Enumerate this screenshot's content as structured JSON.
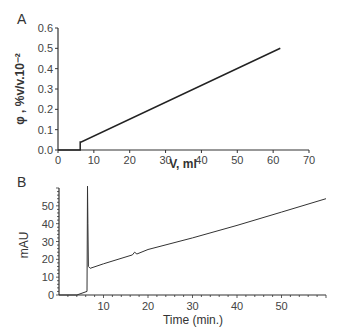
{
  "chart_data": [
    {
      "panel": "A",
      "type": "line",
      "title": "",
      "xlabel": "V, ml",
      "ylabel": "φ , %v/v.10⁻²",
      "xlim": [
        0,
        70
      ],
      "ylim": [
        0,
        0.6
      ],
      "xticks": [
        "0",
        "10",
        "20",
        "30",
        "40",
        "50",
        "60",
        "70"
      ],
      "yticks": [
        "0.0",
        "0.1",
        "0.2",
        "0.3",
        "0.4",
        "0.5",
        "0.6"
      ],
      "grid": false,
      "series": [
        {
          "name": "gradient",
          "x": [
            0,
            6.2,
            6.2,
            6.5,
            62
          ],
          "y": [
            0,
            0,
            0.04,
            0.04,
            0.5
          ]
        }
      ]
    },
    {
      "panel": "B",
      "type": "line",
      "title": "",
      "xlabel": "Time (min.)",
      "ylabel": "mAU",
      "xlim": [
        0,
        60
      ],
      "ylim": [
        0,
        60
      ],
      "xticks": [
        "10",
        "20",
        "30",
        "40",
        "50"
      ],
      "yticks": [
        "0",
        "10",
        "20",
        "30",
        "40",
        "50"
      ],
      "grid": false,
      "series": [
        {
          "name": "absorbance",
          "x": [
            0,
            4,
            6.3,
            6.4,
            6.5,
            6.6,
            7,
            10,
            16.5,
            17,
            17.5,
            20,
            30,
            40,
            50,
            60
          ],
          "y": [
            0,
            0,
            2,
            61,
            40,
            16,
            15,
            17.5,
            22.5,
            24,
            23,
            25.5,
            32,
            39,
            46.5,
            54
          ]
        }
      ]
    }
  ],
  "labels": {
    "panel_a": "A",
    "panel_b": "B"
  }
}
